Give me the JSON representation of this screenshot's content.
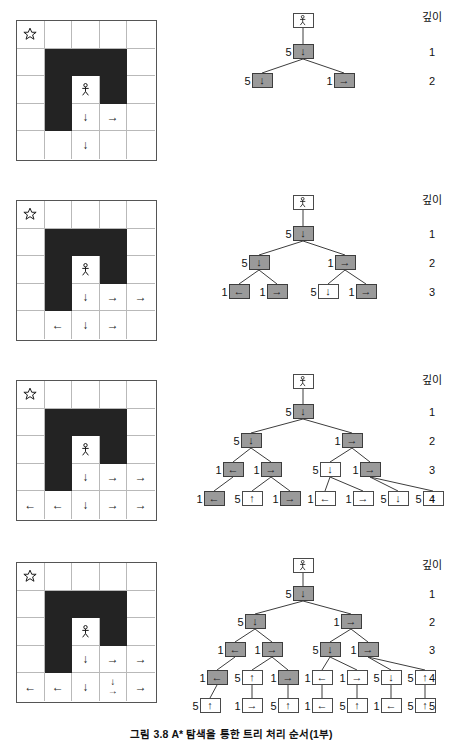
{
  "figure": {
    "caption": "그림 3.8  A* 탐색을 통한 트리 처리 순서(1부)",
    "depth_header": "깊이",
    "icons": {
      "goal": "star-icon",
      "agent": "person-icon",
      "up": "↑",
      "down": "↓",
      "left": "←",
      "right": "→"
    },
    "colors": {
      "wall": "#232323",
      "expanded_node": "#9a9a9a",
      "frontier_node": "#ffffff",
      "grid_line": "#b9b9b9",
      "grid_border": "#555555",
      "link": "#3d3d3d"
    }
  },
  "panels": [
    {
      "id": "panel-1",
      "grid": {
        "rows": 5,
        "cols": 5,
        "walls": [
          [
            1,
            1
          ],
          [
            1,
            2
          ],
          [
            1,
            3
          ],
          [
            2,
            1
          ],
          [
            2,
            3
          ],
          [
            3,
            1
          ]
        ],
        "goal": [
          0,
          0
        ],
        "agent": [
          2,
          2
        ],
        "marks": [
          {
            "r": 3,
            "c": 2,
            "glyph": "↓"
          },
          {
            "r": 3,
            "c": 3,
            "glyph": "→"
          },
          {
            "r": 4,
            "c": 2,
            "glyph": "↓"
          }
        ]
      },
      "tree": {
        "depths": [
          "1",
          "2"
        ],
        "nodes": [
          {
            "id": "r",
            "level": 0,
            "x": 303,
            "y": 9,
            "kind": "agent",
            "fill": "white",
            "cost": null
          },
          {
            "id": "a",
            "level": 1,
            "x": 303,
            "y": 40,
            "glyph": "↓",
            "fill": "gray",
            "cost": "5"
          },
          {
            "id": "b",
            "level": 2,
            "x": 262,
            "y": 69,
            "glyph": "↓",
            "fill": "gray",
            "cost": "5"
          },
          {
            "id": "c",
            "level": 2,
            "x": 344,
            "y": 69,
            "glyph": "→",
            "fill": "gray",
            "cost": "1"
          }
        ],
        "links": [
          [
            "r",
            "a"
          ],
          [
            "a",
            "b"
          ],
          [
            "a",
            "c"
          ]
        ]
      }
    },
    {
      "id": "panel-2",
      "grid": {
        "rows": 5,
        "cols": 5,
        "walls": [
          [
            1,
            1
          ],
          [
            1,
            2
          ],
          [
            1,
            3
          ],
          [
            2,
            1
          ],
          [
            2,
            3
          ],
          [
            3,
            1
          ]
        ],
        "goal": [
          0,
          0
        ],
        "agent": [
          2,
          2
        ],
        "marks": [
          {
            "r": 3,
            "c": 2,
            "glyph": "↓"
          },
          {
            "r": 3,
            "c": 3,
            "glyph": "→"
          },
          {
            "r": 3,
            "c": 4,
            "glyph": "→"
          },
          {
            "r": 4,
            "c": 1,
            "glyph": "←"
          },
          {
            "r": 4,
            "c": 2,
            "glyph": "↓"
          },
          {
            "r": 4,
            "c": 3,
            "glyph": "→"
          }
        ]
      },
      "tree": {
        "depths": [
          "1",
          "2",
          "3"
        ],
        "nodes": [
          {
            "id": "r",
            "level": 0,
            "x": 303,
            "y": 9,
            "kind": "agent",
            "fill": "white",
            "cost": null
          },
          {
            "id": "a",
            "level": 1,
            "x": 303,
            "y": 40,
            "glyph": "↓",
            "fill": "gray",
            "cost": "5"
          },
          {
            "id": "b",
            "level": 2,
            "x": 259,
            "y": 69,
            "glyph": "↓",
            "fill": "gray",
            "cost": "5"
          },
          {
            "id": "c",
            "level": 2,
            "x": 345,
            "y": 69,
            "glyph": "→",
            "fill": "gray",
            "cost": "1"
          },
          {
            "id": "d",
            "level": 3,
            "x": 239,
            "y": 98,
            "glyph": "←",
            "fill": "gray",
            "cost": "1"
          },
          {
            "id": "e",
            "level": 3,
            "x": 277,
            "y": 98,
            "glyph": "→",
            "fill": "gray",
            "cost": "1"
          },
          {
            "id": "f",
            "level": 3,
            "x": 328,
            "y": 98,
            "glyph": "↓",
            "fill": "white",
            "cost": "5"
          },
          {
            "id": "g",
            "level": 3,
            "x": 366,
            "y": 98,
            "glyph": "→",
            "fill": "gray",
            "cost": "1"
          }
        ],
        "links": [
          [
            "r",
            "a"
          ],
          [
            "a",
            "b"
          ],
          [
            "a",
            "c"
          ],
          [
            "b",
            "d"
          ],
          [
            "b",
            "e"
          ],
          [
            "c",
            "f"
          ],
          [
            "c",
            "g"
          ]
        ]
      }
    },
    {
      "id": "panel-3",
      "grid": {
        "rows": 5,
        "cols": 5,
        "walls": [
          [
            1,
            1
          ],
          [
            1,
            2
          ],
          [
            1,
            3
          ],
          [
            2,
            1
          ],
          [
            2,
            3
          ],
          [
            3,
            1
          ]
        ],
        "goal": [
          0,
          0
        ],
        "agent": [
          2,
          2
        ],
        "marks": [
          {
            "r": 3,
            "c": 2,
            "glyph": "↓"
          },
          {
            "r": 3,
            "c": 3,
            "glyph": "→"
          },
          {
            "r": 3,
            "c": 4,
            "glyph": "→"
          },
          {
            "r": 4,
            "c": 0,
            "glyph": "←"
          },
          {
            "r": 4,
            "c": 1,
            "glyph": "←"
          },
          {
            "r": 4,
            "c": 2,
            "glyph": "↓"
          },
          {
            "r": 4,
            "c": 3,
            "glyph": "→"
          },
          {
            "r": 4,
            "c": 4,
            "glyph": "→"
          }
        ]
      },
      "tree": {
        "depths": [
          "1",
          "2",
          "3",
          "4"
        ],
        "nodes": [
          {
            "id": "r",
            "level": 0,
            "x": 303,
            "y": 8,
            "kind": "agent",
            "fill": "white",
            "cost": null
          },
          {
            "id": "a",
            "level": 1,
            "x": 303,
            "y": 38,
            "glyph": "↓",
            "fill": "gray",
            "cost": "5"
          },
          {
            "id": "b",
            "level": 2,
            "x": 251,
            "y": 67,
            "glyph": "↓",
            "fill": "gray",
            "cost": "5"
          },
          {
            "id": "c",
            "level": 2,
            "x": 352,
            "y": 67,
            "glyph": "→",
            "fill": "gray",
            "cost": "1"
          },
          {
            "id": "d",
            "level": 3,
            "x": 233,
            "y": 96,
            "glyph": "←",
            "fill": "gray",
            "cost": "1"
          },
          {
            "id": "e",
            "level": 3,
            "x": 271,
            "y": 96,
            "glyph": "→",
            "fill": "gray",
            "cost": "1"
          },
          {
            "id": "f",
            "level": 3,
            "x": 330,
            "y": 96,
            "glyph": "↓",
            "fill": "white",
            "cost": "5"
          },
          {
            "id": "g",
            "level": 3,
            "x": 370,
            "y": 96,
            "glyph": "→",
            "fill": "gray",
            "cost": "1"
          },
          {
            "id": "h",
            "level": 4,
            "x": 214,
            "y": 125,
            "glyph": "←",
            "fill": "gray",
            "cost": "1"
          },
          {
            "id": "i",
            "level": 4,
            "x": 252,
            "y": 125,
            "glyph": "↑",
            "fill": "white",
            "cost": "5"
          },
          {
            "id": "j",
            "level": 4,
            "x": 290,
            "y": 125,
            "glyph": "→",
            "fill": "gray",
            "cost": "1"
          },
          {
            "id": "k",
            "level": 4,
            "x": 325,
            "y": 125,
            "glyph": "←",
            "fill": "white",
            "cost": "1"
          },
          {
            "id": "l",
            "level": 4,
            "x": 363,
            "y": 125,
            "glyph": "→",
            "fill": "white",
            "cost": "1"
          },
          {
            "id": "m",
            "level": 4,
            "x": 398,
            "y": 125,
            "glyph": "↓",
            "fill": "white",
            "cost": "5"
          },
          {
            "id": "n",
            "level": 4,
            "x": 433,
            "y": 125,
            "glyph": "↑",
            "fill": "white",
            "cost": "5"
          }
        ],
        "links": [
          [
            "r",
            "a"
          ],
          [
            "a",
            "b"
          ],
          [
            "a",
            "c"
          ],
          [
            "b",
            "d"
          ],
          [
            "b",
            "e"
          ],
          [
            "c",
            "f"
          ],
          [
            "c",
            "g"
          ],
          [
            "d",
            "h"
          ],
          [
            "e",
            "i"
          ],
          [
            "e",
            "j"
          ],
          [
            "f",
            "k"
          ],
          [
            "f",
            "l"
          ],
          [
            "g",
            "m"
          ],
          [
            "g",
            "n"
          ]
        ]
      }
    },
    {
      "id": "panel-4",
      "grid": {
        "rows": 5,
        "cols": 5,
        "walls": [
          [
            1,
            1
          ],
          [
            1,
            2
          ],
          [
            1,
            3
          ],
          [
            2,
            1
          ],
          [
            2,
            3
          ],
          [
            3,
            1
          ]
        ],
        "goal": [
          0,
          0
        ],
        "agent": [
          2,
          2
        ],
        "marks": [
          {
            "r": 3,
            "c": 2,
            "glyph": "↓"
          },
          {
            "r": 3,
            "c": 3,
            "glyph": "→"
          },
          {
            "r": 3,
            "c": 4,
            "glyph": "→"
          },
          {
            "r": 4,
            "c": 0,
            "glyph": "←"
          },
          {
            "r": 4,
            "c": 1,
            "glyph": "←"
          },
          {
            "r": 4,
            "c": 2,
            "glyph": "↓"
          },
          {
            "r": 4,
            "c": 3,
            "glyph": "↓→"
          },
          {
            "r": 4,
            "c": 4,
            "glyph": "→"
          }
        ]
      },
      "tree": {
        "depths": [
          "1",
          "2",
          "3",
          "4",
          "5"
        ],
        "nodes": [
          {
            "id": "r",
            "level": 0,
            "x": 303,
            "y": 6,
            "kind": "agent",
            "fill": "white",
            "cost": null
          },
          {
            "id": "a",
            "level": 1,
            "x": 303,
            "y": 34,
            "glyph": "↓",
            "fill": "gray",
            "cost": "5"
          },
          {
            "id": "b",
            "level": 2,
            "x": 255,
            "y": 62,
            "glyph": "↓",
            "fill": "gray",
            "cost": "5"
          },
          {
            "id": "c",
            "level": 2,
            "x": 351,
            "y": 62,
            "glyph": "→",
            "fill": "gray",
            "cost": "1"
          },
          {
            "id": "d",
            "level": 3,
            "x": 235,
            "y": 90,
            "glyph": "←",
            "fill": "gray",
            "cost": "1"
          },
          {
            "id": "e",
            "level": 3,
            "x": 272,
            "y": 90,
            "glyph": "→",
            "fill": "gray",
            "cost": "1"
          },
          {
            "id": "f",
            "level": 3,
            "x": 330,
            "y": 90,
            "glyph": "↓",
            "fill": "gray",
            "cost": "5"
          },
          {
            "id": "g",
            "level": 3,
            "x": 368,
            "y": 90,
            "glyph": "→",
            "fill": "gray",
            "cost": "1"
          },
          {
            "id": "h",
            "level": 4,
            "x": 217,
            "y": 118,
            "glyph": "←",
            "fill": "gray",
            "cost": "1"
          },
          {
            "id": "i",
            "level": 4,
            "x": 252,
            "y": 118,
            "glyph": "↑",
            "fill": "white",
            "cost": "5"
          },
          {
            "id": "j",
            "level": 4,
            "x": 288,
            "y": 118,
            "glyph": "→",
            "fill": "gray",
            "cost": "1"
          },
          {
            "id": "k",
            "level": 4,
            "x": 322,
            "y": 118,
            "glyph": "←",
            "fill": "white",
            "cost": "1"
          },
          {
            "id": "l",
            "level": 4,
            "x": 357,
            "y": 118,
            "glyph": "→",
            "fill": "white",
            "cost": "1"
          },
          {
            "id": "m",
            "level": 4,
            "x": 391,
            "y": 118,
            "glyph": "↓",
            "fill": "white",
            "cost": "5"
          },
          {
            "id": "n",
            "level": 4,
            "x": 425,
            "y": 118,
            "glyph": "↑",
            "fill": "white",
            "cost": "5"
          },
          {
            "id": "o",
            "level": 5,
            "x": 210,
            "y": 146,
            "glyph": "↑",
            "fill": "white",
            "cost": "5"
          },
          {
            "id": "p",
            "level": 5,
            "x": 252,
            "y": 146,
            "glyph": "→",
            "fill": "white",
            "cost": "1"
          },
          {
            "id": "q",
            "level": 5,
            "x": 288,
            "y": 146,
            "glyph": "↑",
            "fill": "white",
            "cost": "5"
          },
          {
            "id": "s",
            "level": 5,
            "x": 322,
            "y": 146,
            "glyph": "←",
            "fill": "white",
            "cost": "1"
          },
          {
            "id": "t",
            "level": 5,
            "x": 357,
            "y": 146,
            "glyph": "↑",
            "fill": "white",
            "cost": "5"
          },
          {
            "id": "u",
            "level": 5,
            "x": 391,
            "y": 146,
            "glyph": "←",
            "fill": "white",
            "cost": "1"
          },
          {
            "id": "v",
            "level": 5,
            "x": 425,
            "y": 146,
            "glyph": "↑",
            "fill": "white",
            "cost": "5"
          }
        ],
        "links": [
          [
            "r",
            "a"
          ],
          [
            "a",
            "b"
          ],
          [
            "a",
            "c"
          ],
          [
            "b",
            "d"
          ],
          [
            "b",
            "e"
          ],
          [
            "c",
            "f"
          ],
          [
            "c",
            "g"
          ],
          [
            "d",
            "h"
          ],
          [
            "e",
            "i"
          ],
          [
            "e",
            "j"
          ],
          [
            "f",
            "k"
          ],
          [
            "f",
            "l"
          ],
          [
            "g",
            "m"
          ],
          [
            "g",
            "n"
          ],
          [
            "h",
            "o"
          ],
          [
            "i",
            "p"
          ],
          [
            "j",
            "q"
          ],
          [
            "k",
            "s"
          ],
          [
            "l",
            "t"
          ],
          [
            "m",
            "u"
          ],
          [
            "n",
            "v"
          ]
        ]
      }
    }
  ]
}
